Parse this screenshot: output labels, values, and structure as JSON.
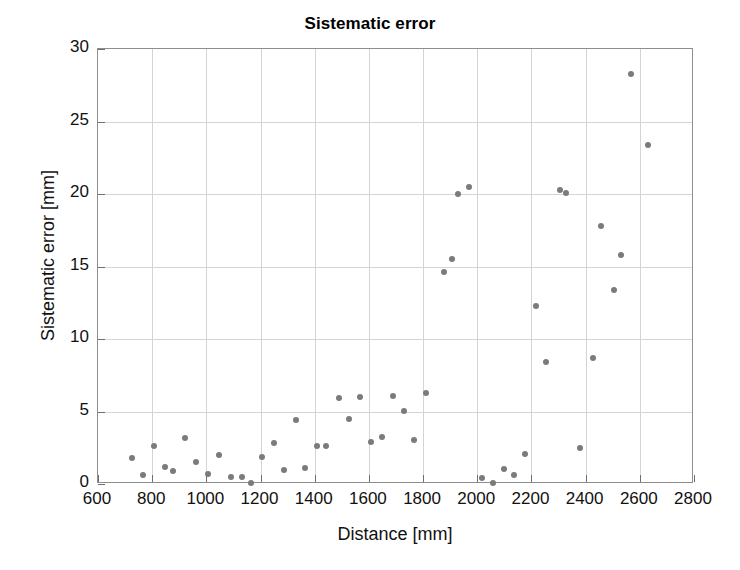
{
  "chart_data": {
    "type": "scatter",
    "title": "Sistematic error",
    "xlabel": "Distance [mm]",
    "ylabel": "Sistematic error [mm]",
    "xlim": [
      600,
      2800
    ],
    "ylim": [
      0,
      30
    ],
    "xticks": [
      600,
      800,
      1000,
      1200,
      1400,
      1600,
      1800,
      2000,
      2200,
      2400,
      2600,
      2800
    ],
    "yticks": [
      0,
      5,
      10,
      15,
      20,
      25,
      30
    ],
    "grid": true,
    "legend": null,
    "marker_color": "#7b7b7b",
    "points": [
      {
        "x": 727,
        "y": 1.8
      },
      {
        "x": 767,
        "y": 0.6
      },
      {
        "x": 805,
        "y": 2.6
      },
      {
        "x": 848,
        "y": 1.2
      },
      {
        "x": 878,
        "y": 0.9
      },
      {
        "x": 922,
        "y": 3.2
      },
      {
        "x": 962,
        "y": 1.5
      },
      {
        "x": 1005,
        "y": 0.7
      },
      {
        "x": 1048,
        "y": 2.0
      },
      {
        "x": 1090,
        "y": 0.45
      },
      {
        "x": 1130,
        "y": 0.45
      },
      {
        "x": 1165,
        "y": 0.1
      },
      {
        "x": 1205,
        "y": 1.85
      },
      {
        "x": 1248,
        "y": 2.8
      },
      {
        "x": 1288,
        "y": 0.95
      },
      {
        "x": 1330,
        "y": 4.4
      },
      {
        "x": 1365,
        "y": 1.1
      },
      {
        "x": 1408,
        "y": 2.6
      },
      {
        "x": 1440,
        "y": 2.65
      },
      {
        "x": 1488,
        "y": 5.9
      },
      {
        "x": 1525,
        "y": 4.5
      },
      {
        "x": 1568,
        "y": 6.0
      },
      {
        "x": 1608,
        "y": 2.9
      },
      {
        "x": 1648,
        "y": 3.25
      },
      {
        "x": 1690,
        "y": 6.1
      },
      {
        "x": 1728,
        "y": 5.05
      },
      {
        "x": 1768,
        "y": 3.05
      },
      {
        "x": 1812,
        "y": 6.25
      },
      {
        "x": 1878,
        "y": 14.6
      },
      {
        "x": 1908,
        "y": 15.5
      },
      {
        "x": 1928,
        "y": 20.0
      },
      {
        "x": 1968,
        "y": 20.5
      },
      {
        "x": 2018,
        "y": 0.4
      },
      {
        "x": 2058,
        "y": 0.1
      },
      {
        "x": 2098,
        "y": 1.05
      },
      {
        "x": 2135,
        "y": 0.6
      },
      {
        "x": 2178,
        "y": 2.05
      },
      {
        "x": 2218,
        "y": 12.3
      },
      {
        "x": 2252,
        "y": 8.4
      },
      {
        "x": 2305,
        "y": 20.3
      },
      {
        "x": 2328,
        "y": 20.1
      },
      {
        "x": 2378,
        "y": 2.5
      },
      {
        "x": 2428,
        "y": 8.7
      },
      {
        "x": 2455,
        "y": 17.8
      },
      {
        "x": 2505,
        "y": 13.4
      },
      {
        "x": 2530,
        "y": 15.8
      },
      {
        "x": 2566,
        "y": 28.3
      },
      {
        "x": 2632,
        "y": 23.4
      }
    ]
  }
}
